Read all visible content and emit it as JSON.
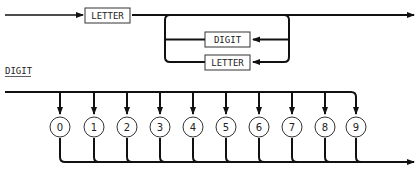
{
  "identifier_diagram": {
    "start_box": "LETTER",
    "loop_boxes": [
      "DIGIT",
      "LETTER"
    ]
  },
  "digit_diagram": {
    "title": "DIGIT",
    "digits": [
      "0",
      "1",
      "2",
      "3",
      "4",
      "5",
      "6",
      "7",
      "8",
      "9"
    ]
  }
}
